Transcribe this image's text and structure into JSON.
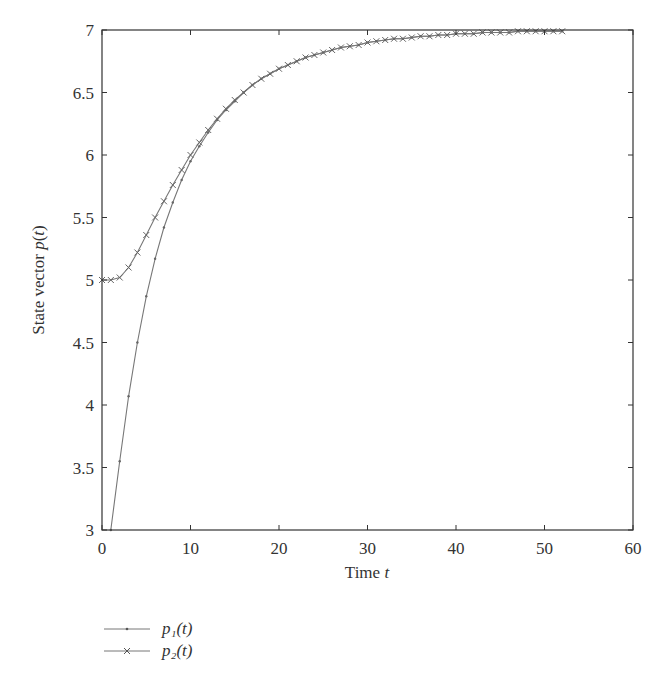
{
  "chart_data": {
    "type": "line",
    "title": "",
    "xlabel": "Time t",
    "ylabel": "State vector p(t)",
    "xlim": [
      0,
      60
    ],
    "ylim": [
      3,
      7
    ],
    "xticks": [
      0,
      10,
      20,
      30,
      40,
      50,
      60
    ],
    "yticks": [
      3,
      3.5,
      4,
      4.5,
      5,
      5.5,
      6,
      6.5,
      7
    ],
    "ytick_labels": [
      "3",
      "3.5",
      "4",
      "4.5",
      "5",
      "5.5",
      "6",
      "6.5",
      "7"
    ],
    "grid": false,
    "legend_position": "below-left",
    "series": [
      {
        "name": "p1(t)",
        "marker": "dot",
        "x": [
          1,
          2,
          3,
          4,
          5,
          6,
          7,
          8,
          9,
          10,
          11,
          12,
          13,
          14,
          15,
          16,
          17,
          18,
          19,
          20,
          21,
          22,
          23,
          24,
          25,
          26,
          27,
          28,
          29,
          30,
          31,
          32,
          33,
          34,
          35,
          36,
          37,
          38,
          39,
          40,
          41,
          42,
          43,
          44,
          45,
          46,
          47,
          48,
          49,
          50,
          51,
          52
        ],
        "values": [
          3.0,
          3.55,
          4.07,
          4.5,
          4.87,
          5.17,
          5.42,
          5.62,
          5.8,
          5.95,
          6.07,
          6.18,
          6.28,
          6.36,
          6.43,
          6.5,
          6.56,
          6.61,
          6.65,
          6.69,
          6.72,
          6.75,
          6.78,
          6.8,
          6.82,
          6.84,
          6.86,
          6.87,
          6.88,
          6.9,
          6.91,
          6.92,
          6.93,
          6.93,
          6.94,
          6.95,
          6.95,
          6.96,
          6.96,
          6.97,
          6.97,
          6.97,
          6.98,
          6.98,
          6.98,
          6.98,
          6.99,
          6.99,
          6.99,
          6.99,
          6.99,
          6.99
        ]
      },
      {
        "name": "p2(t)",
        "marker": "x",
        "x": [
          0,
          1,
          2,
          3,
          4,
          5,
          6,
          7,
          8,
          9,
          10,
          11,
          12,
          13,
          14,
          15,
          16,
          17,
          18,
          19,
          20,
          21,
          22,
          23,
          24,
          25,
          26,
          27,
          28,
          29,
          30,
          31,
          32,
          33,
          34,
          35,
          36,
          37,
          38,
          39,
          40,
          41,
          42,
          43,
          44,
          45,
          46,
          47,
          48,
          49,
          50,
          51,
          52
        ],
        "values": [
          5.0,
          5.0,
          5.02,
          5.1,
          5.22,
          5.36,
          5.5,
          5.63,
          5.76,
          5.88,
          6.0,
          6.1,
          6.2,
          6.29,
          6.37,
          6.44,
          6.5,
          6.56,
          6.61,
          6.65,
          6.69,
          6.72,
          6.75,
          6.78,
          6.8,
          6.82,
          6.84,
          6.86,
          6.87,
          6.88,
          6.9,
          6.91,
          6.92,
          6.93,
          6.93,
          6.94,
          6.95,
          6.95,
          6.96,
          6.96,
          6.97,
          6.97,
          6.97,
          6.98,
          6.98,
          6.98,
          6.98,
          6.99,
          6.99,
          6.99,
          6.99,
          6.99,
          6.99
        ]
      }
    ]
  },
  "legend": {
    "items": [
      {
        "label": "p₁(t)",
        "marker": "dot"
      },
      {
        "label": "p₂(t)",
        "marker": "x"
      }
    ]
  },
  "colors": {
    "axis": "#333333",
    "line": "#777777",
    "text": "#333333"
  }
}
